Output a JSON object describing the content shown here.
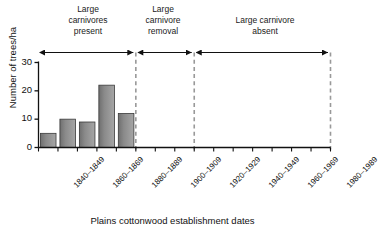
{
  "chart_data": {
    "type": "bar",
    "title": "",
    "xlabel": "Plains cottonwood establishment dates",
    "ylabel": "Number of trees/ha",
    "categories": [
      "1840–1849",
      "1850–1859",
      "1860–1869",
      "1870–1879",
      "1880–1889",
      "1890–1899",
      "1900–1909",
      "1910–1919",
      "1920–1929",
      "1930–1939",
      "1940–1949",
      "1950–1959",
      "1960–1969",
      "1970–1979",
      "1980–1989"
    ],
    "tick_labels_shown": [
      "1840–1849",
      "",
      "1860–1869",
      "",
      "1880–1889",
      "",
      "1900–1909",
      "",
      "1920–1929",
      "",
      "1940–1949",
      "",
      "1960–1969",
      "",
      "1980–1989"
    ],
    "values": [
      5,
      10,
      9,
      22,
      12,
      0,
      0,
      0,
      0,
      0,
      0,
      0,
      0,
      0,
      0
    ],
    "ylim": [
      0,
      31
    ],
    "yticks": [
      0,
      10,
      20,
      30
    ],
    "ytick_labels": [
      "0",
      "10",
      "20",
      "30"
    ],
    "grid": false,
    "legend": "none",
    "bar_color": "#7a7a7a",
    "bar_edge_color": "#3a3a3a",
    "annotations": [
      {
        "label": "Large\ncarnivores\npresent",
        "start_index": 0,
        "end_index": 5
      },
      {
        "label": "Large\ncarnivore\nremoval",
        "start_index": 5,
        "end_index": 8
      },
      {
        "label": "Large carnivore\nabsent",
        "start_index": 8,
        "end_index": 15
      }
    ],
    "divider_color": "#999999",
    "axis_color": "#111111"
  }
}
